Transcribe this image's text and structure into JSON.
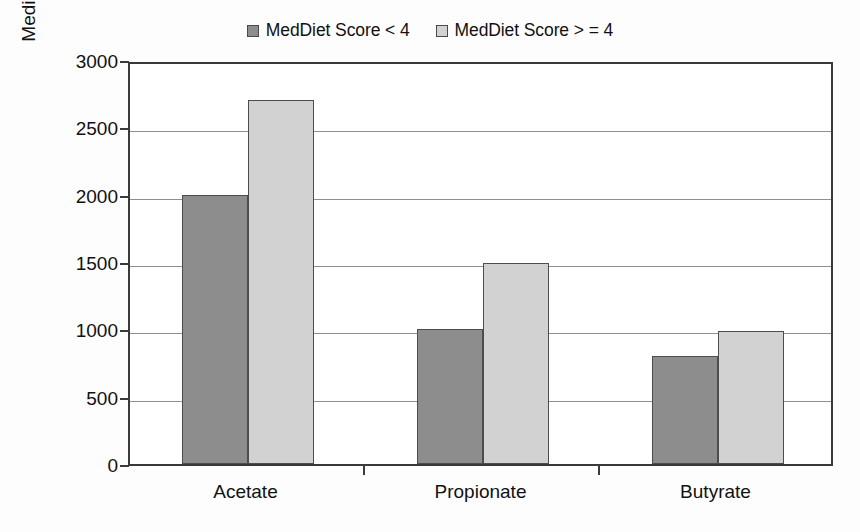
{
  "chart_data": {
    "type": "bar",
    "title": "",
    "xlabel": "",
    "ylabel": "Median Fecal SCFAs (µg/ml)",
    "categories": [
      "Acetate",
      "Propionate",
      "Butyrate"
    ],
    "series": [
      {
        "name": "MedDiet Score < 4",
        "color": "#8d8d8d",
        "values": [
          2000,
          1000,
          800
        ]
      },
      {
        "name": "MedDiet Score > = 4",
        "color": "#d2d2d2",
        "values": [
          2700,
          1490,
          990
        ]
      }
    ],
    "ylim": [
      0,
      3000
    ],
    "ytick_labels": [
      "3000",
      "2500",
      "2000",
      "1500",
      "1000",
      "500",
      "0"
    ],
    "ytick_values": [
      3000,
      2500,
      2000,
      1500,
      1000,
      500,
      0
    ],
    "grid": "horizontal",
    "legend_position": "top-center",
    "axis_color": "#3a3a3a",
    "gridline_color": "#8f8f8f",
    "background": "#ffffff"
  },
  "legend": {
    "entries": [
      {
        "label": "MedDiet Score < 4",
        "swatch": "#8d8d8d"
      },
      {
        "label": "MedDiet Score > = 4",
        "swatch": "#d2d2d2"
      }
    ]
  }
}
